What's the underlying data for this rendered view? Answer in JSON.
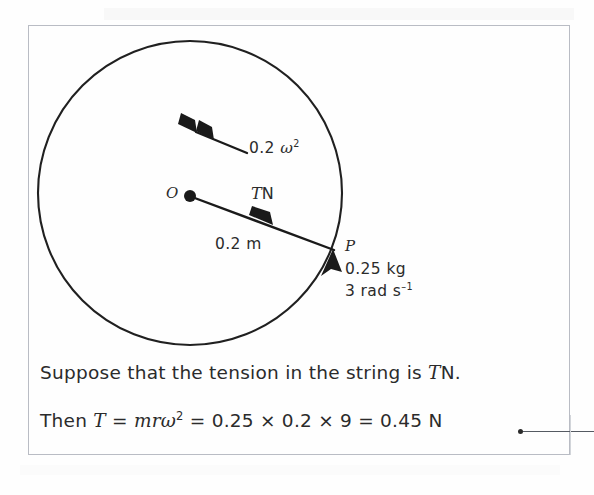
{
  "figure": {
    "circle": {
      "center_label": "O",
      "radius_label": "0.2 m",
      "point_label": "P"
    },
    "vectors": [
      {
        "name": "acceleration",
        "label": "0.2 ",
        "label_symbol": "ω",
        "label_exponent": "2",
        "direction": "up-left toward centre",
        "arrow_style": "double-chevron"
      },
      {
        "name": "tension",
        "label_symbol": "T",
        "label_unit": "N",
        "direction": "from P toward O",
        "arrow_style": "single"
      },
      {
        "name": "velocity",
        "direction": "tangential at P",
        "arrow_style": "single"
      }
    ],
    "particle": {
      "mass": "0.25 kg",
      "angular_speed": "3 rad s",
      "angular_speed_exponent": "–1"
    }
  },
  "prose": {
    "line1_pre": "Suppose that the tension in the string is ",
    "line1_symbol": "T",
    "line1_post": "N.",
    "line2_pre": "Then ",
    "line2_symbol_t": "T",
    "line2_eq1": " = ",
    "line2_symbol_mr": "mr",
    "line2_symbol_omega": "ω",
    "line2_omega_exponent": "2",
    "line2_post": " = 0.25 × 0.2 × 9 = 0.45 N"
  },
  "callout": {
    "present": true,
    "description": "leader line from result to margin annotation"
  },
  "colors": {
    "ink": "#2b2b2b",
    "border": "#b9bcc4",
    "page": "#ffffff",
    "leader": "#555a62"
  }
}
